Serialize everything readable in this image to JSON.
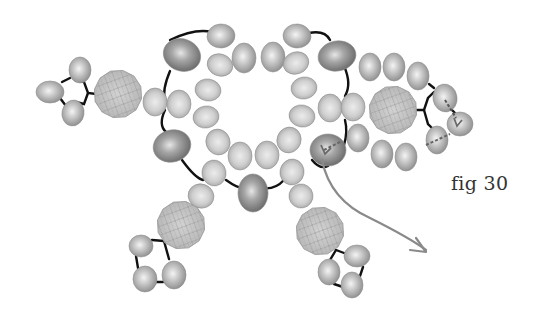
{
  "figure": {
    "caption": "fig 30",
    "colors": {
      "background": "#ffffff",
      "bead_light": "#e8e8e8",
      "bead_mid": "#b4b4b4",
      "bead_dark": "#7a7a7a",
      "crystal": "#c4c4c4",
      "crystal_lines": "#9c9c9c",
      "thread": "#111111",
      "arrow": "#8a8a8a",
      "caption": "#333333"
    }
  },
  "beads": {
    "large_dark": [
      {
        "cx": 182,
        "cy": 55,
        "rx": 19,
        "ry": 16,
        "rot": 20
      },
      {
        "cx": 337,
        "cy": 56,
        "rx": 19,
        "ry": 15,
        "rot": -10
      },
      {
        "cx": 172,
        "cy": 146,
        "rx": 19,
        "ry": 16,
        "rot": -15
      },
      {
        "cx": 328,
        "cy": 150,
        "rx": 18,
        "ry": 16,
        "rot": 0
      },
      {
        "cx": 253,
        "cy": 193,
        "rx": 15,
        "ry": 19,
        "rot": 0
      }
    ],
    "outer_top": [
      {
        "cx": 221,
        "cy": 36,
        "rx": 14,
        "ry": 12,
        "rot": -5
      },
      {
        "cx": 297,
        "cy": 36,
        "rx": 14,
        "ry": 12,
        "rot": 5
      },
      {
        "cx": 244,
        "cy": 58,
        "rx": 12,
        "ry": 15,
        "rot": 0
      },
      {
        "cx": 273,
        "cy": 57,
        "rx": 12,
        "ry": 15,
        "rot": 0
      }
    ],
    "inner_ring": [
      {
        "cx": 220,
        "cy": 65,
        "rx": 13,
        "ry": 11,
        "rot": 20
      },
      {
        "cx": 208,
        "cy": 90,
        "rx": 13,
        "ry": 11,
        "rot": 10
      },
      {
        "cx": 206,
        "cy": 117,
        "rx": 13,
        "ry": 11,
        "rot": -10
      },
      {
        "cx": 218,
        "cy": 142,
        "rx": 12,
        "ry": 13,
        "rot": -20
      },
      {
        "cx": 240,
        "cy": 156,
        "rx": 12,
        "ry": 14,
        "rot": 0
      },
      {
        "cx": 267,
        "cy": 155,
        "rx": 12,
        "ry": 14,
        "rot": 0
      },
      {
        "cx": 289,
        "cy": 140,
        "rx": 12,
        "ry": 13,
        "rot": 20
      },
      {
        "cx": 302,
        "cy": 116,
        "rx": 13,
        "ry": 11,
        "rot": 10
      },
      {
        "cx": 304,
        "cy": 88,
        "rx": 13,
        "ry": 11,
        "rot": -10
      },
      {
        "cx": 296,
        "cy": 63,
        "rx": 13,
        "ry": 11,
        "rot": -20
      }
    ],
    "side_left": [
      {
        "cx": 155,
        "cy": 102,
        "rx": 12,
        "ry": 14,
        "rot": 0
      },
      {
        "cx": 179,
        "cy": 104,
        "rx": 12,
        "ry": 14,
        "rot": 0
      }
    ],
    "side_right": [
      {
        "cx": 330,
        "cy": 108,
        "rx": 12,
        "ry": 14,
        "rot": 0
      },
      {
        "cx": 353,
        "cy": 107,
        "rx": 12,
        "ry": 14,
        "rot": 0
      }
    ],
    "bottom_legs": [
      {
        "cx": 214,
        "cy": 173,
        "rx": 12,
        "ry": 13,
        "rot": -10
      },
      {
        "cx": 201,
        "cy": 196,
        "rx": 13,
        "ry": 12,
        "rot": 20
      },
      {
        "cx": 292,
        "cy": 172,
        "rx": 12,
        "ry": 13,
        "rot": 10
      },
      {
        "cx": 301,
        "cy": 196,
        "rx": 12,
        "ry": 12,
        "rot": -10
      }
    ],
    "right_arm_top": [
      {
        "cx": 370,
        "cy": 67,
        "rx": 11,
        "ry": 14,
        "rot": 0
      },
      {
        "cx": 394,
        "cy": 67,
        "rx": 11,
        "ry": 14,
        "rot": 0
      },
      {
        "cx": 418,
        "cy": 76,
        "rx": 11,
        "ry": 14,
        "rot": 0
      }
    ],
    "right_arm_bottom": [
      {
        "cx": 358,
        "cy": 138,
        "rx": 11,
        "ry": 14,
        "rot": 0
      },
      {
        "cx": 382,
        "cy": 154,
        "rx": 11,
        "ry": 14,
        "rot": 0
      },
      {
        "cx": 406,
        "cy": 157,
        "rx": 11,
        "ry": 14,
        "rot": 0
      }
    ],
    "picots": [
      {
        "beads": [
          {
            "cx": 80,
            "cy": 70,
            "rx": 11,
            "ry": 13,
            "rot": 0
          },
          {
            "cx": 50,
            "cy": 92,
            "rx": 14,
            "ry": 11,
            "rot": 0
          },
          {
            "cx": 73,
            "cy": 113,
            "rx": 11,
            "ry": 13,
            "rot": 10
          }
        ]
      },
      {
        "beads": [
          {
            "cx": 141,
            "cy": 246,
            "rx": 12,
            "ry": 11,
            "rot": 0
          },
          {
            "cx": 145,
            "cy": 279,
            "rx": 12,
            "ry": 13,
            "rot": 0
          },
          {
            "cx": 174,
            "cy": 275,
            "rx": 12,
            "ry": 14,
            "rot": 0
          }
        ]
      },
      {
        "beads": [
          {
            "cx": 357,
            "cy": 256,
            "rx": 13,
            "ry": 11,
            "rot": 0
          },
          {
            "cx": 329,
            "cy": 272,
            "rx": 11,
            "ry": 13,
            "rot": 0
          },
          {
            "cx": 352,
            "cy": 285,
            "rx": 11,
            "ry": 13,
            "rot": 0
          }
        ]
      },
      {
        "beads": [
          {
            "cx": 445,
            "cy": 98,
            "rx": 12,
            "ry": 14,
            "rot": -10
          },
          {
            "cx": 460,
            "cy": 124,
            "rx": 13,
            "ry": 12,
            "rot": 0
          },
          {
            "cx": 437,
            "cy": 140,
            "rx": 11,
            "ry": 14,
            "rot": 0
          }
        ]
      }
    ]
  },
  "crystals": [
    {
      "cx": 118,
      "cy": 94,
      "r": 24
    },
    {
      "cx": 393,
      "cy": 110,
      "r": 24
    },
    {
      "cx": 181,
      "cy": 225,
      "r": 24
    },
    {
      "cx": 320,
      "cy": 231,
      "r": 24
    }
  ],
  "threads": [
    "M170 40 Q 195 28 212 32",
    "M309 33 Q 325 30 330 40",
    "M170 71 Q 162 90 165 100",
    "M165 110 Q 158 125 166 132",
    "M182 160 Q 195 178 203 180",
    "M226 180 Q 240 190 246 188",
    "M262 188 Q 275 190 284 180",
    "M344 66 Q 352 84 345 96",
    "M345 120 Q 348 132 344 145",
    "M312 160 Q 320 170 328 166",
    "M96 94 L 88 93 L 84 82 L 75 80",
    "M88 93 L 84 104 L 76 102",
    "M62 82 L 70 78",
    "M60 98 L 66 106",
    "M164 241 L 152 240",
    "M164 241 L 169 259",
    "M136 256 L 138 268",
    "M156 282 L 163 282",
    "M336 250 L 344 253",
    "M336 250 L 330 260",
    "M363 267 L 360 276",
    "M334 284 L 343 287",
    "M417 110 L 424 110 L 428 98 L 434 92",
    "M424 110 L 428 124 L 434 130",
    "M452 110 L 455 113",
    "M429 84 L 434 88"
  ],
  "thread_path_hints": [
    {
      "type": "dashed",
      "d": "M324 150 L 340 142",
      "color": "#666666"
    },
    {
      "type": "dashed",
      "d": "M426 145 L 450 134",
      "color": "#666666"
    },
    {
      "type": "dashed",
      "d": "M445 100 L 456 118",
      "color": "#555555"
    }
  ],
  "arrow": {
    "path": "M322 160 Q 330 200 370 218 Q 410 238 426 250",
    "head": "M416 238 L 426 252 L 410 250"
  }
}
